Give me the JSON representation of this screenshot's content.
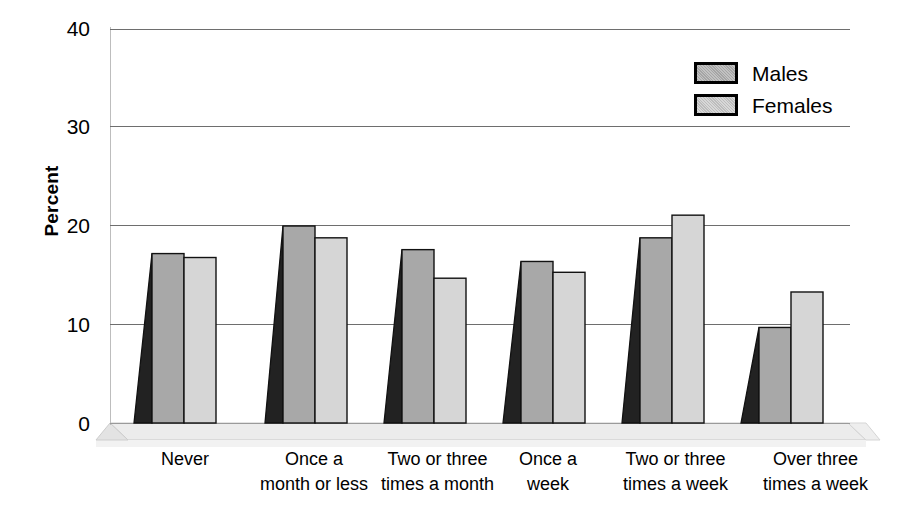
{
  "chart_data": {
    "type": "bar",
    "title": "",
    "xlabel": "",
    "ylabel": "Percent",
    "ylim": [
      0,
      40
    ],
    "yticks": [
      0,
      10,
      20,
      30,
      40
    ],
    "grid": true,
    "legend_position": "top-right",
    "style_3d": true,
    "categories": [
      "Never",
      "Once a\nmonth or less",
      "Two or three\ntimes a month",
      "Once a\nweek",
      "Two or three\ntimes a week",
      "Over three\ntimes a week"
    ],
    "category_lines": [
      [
        "Never",
        ""
      ],
      [
        "Once a",
        "month or less"
      ],
      [
        "Two or three",
        "times a month"
      ],
      [
        "Once a",
        "week"
      ],
      [
        "Two or three",
        "times a week"
      ],
      [
        "Over three",
        "times a week"
      ]
    ],
    "series": [
      {
        "name": "Males",
        "color": "#a8a8a8",
        "values": [
          17.2,
          20.0,
          17.6,
          16.4,
          18.8,
          9.7
        ]
      },
      {
        "name": "Females",
        "color": "#d2d2d2",
        "values": [
          16.8,
          18.8,
          14.7,
          15.3,
          21.1,
          13.3
        ]
      }
    ]
  },
  "axis": {
    "y_label": "Percent",
    "y_ticks": [
      "40",
      "30",
      "20",
      "10",
      "0"
    ]
  },
  "legend": {
    "items": [
      {
        "label": "Males",
        "swatch": "males-swatch"
      },
      {
        "label": "Females",
        "swatch": "females-swatch"
      }
    ]
  },
  "xlabels": [
    {
      "line1": "Never",
      "line2": ""
    },
    {
      "line1": "Once a",
      "line2": "month or less"
    },
    {
      "line1": "Two or three",
      "line2": "times a month"
    },
    {
      "line1": "Once a",
      "line2": "week"
    },
    {
      "line1": "Two or three",
      "line2": "times a week"
    },
    {
      "line1": "Over three",
      "line2": "times a week"
    }
  ],
  "colors": {
    "males_fill": "#a8a8a8",
    "females_fill": "#d2d2d2",
    "bar_outline": "#121212",
    "gridline": "#6e6e6e",
    "floor": "#e9e9e9",
    "shadow_side": "#2a2a2a"
  }
}
